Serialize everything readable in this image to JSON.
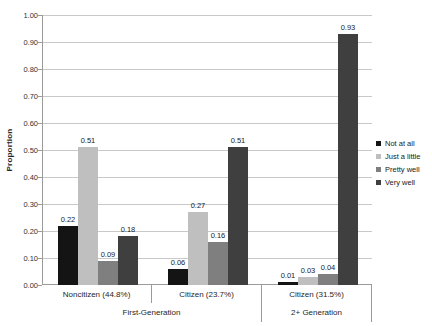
{
  "chart_data": {
    "type": "bar",
    "title": "",
    "xlabel": "",
    "ylabel": "Proportion",
    "ylim": [
      0,
      1
    ],
    "ytick_step": 0.1,
    "ytick_decimals": 2,
    "grid": true,
    "data_labels": true,
    "legend_position": "right",
    "categories": [
      "Noncitizen (44.8%)",
      "Citizen (23.7%)",
      "Citizen (31.5%)"
    ],
    "group_axis": [
      {
        "label": "First-Generation",
        "span": 2
      },
      {
        "label": "2+ Generation",
        "span": 1
      }
    ],
    "series": [
      {
        "name": "Not at all",
        "color": "#141414",
        "values": [
          0.22,
          0.06,
          0.01
        ]
      },
      {
        "name": "Just a little",
        "color": "#bfbfbf",
        "values": [
          0.51,
          0.27,
          0.03
        ]
      },
      {
        "name": "Pretty well",
        "color": "#7f7f7f",
        "values": [
          0.09,
          0.16,
          0.04
        ]
      },
      {
        "name": "Very well",
        "color": "#3f3f3f",
        "values": [
          0.18,
          0.51,
          0.93
        ]
      }
    ],
    "colors": {
      "background": "#ffffff",
      "gridline": "#c9c9c9",
      "axis_line": "#9b9b9b",
      "text": "#262626"
    }
  }
}
